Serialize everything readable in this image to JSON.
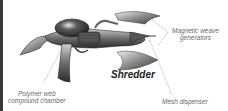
{
  "diagram": {
    "title": "Shredder",
    "labels": [
      {
        "id": "magnetic",
        "lines": [
          "Magnetic weave",
          "generators"
        ]
      },
      {
        "id": "polymer",
        "lines": [
          "Polymer web",
          "compound chamber"
        ]
      },
      {
        "id": "mesh",
        "lines": [
          "Mesh dispenser"
        ]
      }
    ]
  },
  "colors": {
    "border": "#3a3a3a",
    "text": "#6a6a6a",
    "title": "#222222"
  }
}
